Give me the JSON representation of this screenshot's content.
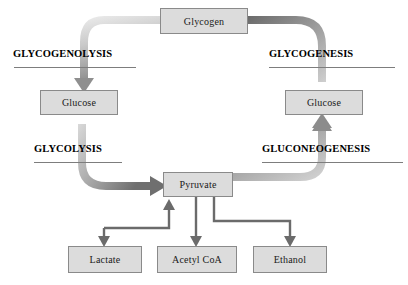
{
  "diagram": {
    "background": "#ffffff",
    "node_fill": "#dcdcdc",
    "node_border": "#8a8a8a",
    "band_light": "#e3e3e3",
    "band_dark": "#6e6e6e",
    "connector_color": "#6b6b6b",
    "label_color": "#000000"
  },
  "nodes": {
    "glycogen": "Glycogen",
    "glucose_left": "Glucose",
    "glucose_right": "Glucose",
    "pyruvate": "Pyruvate",
    "lactate": "Lactate",
    "acetyl_coa": "Acetyl CoA",
    "ethanol": "Ethanol"
  },
  "pathways": {
    "glycogenolysis": "GLYCOGENOLYSIS",
    "glycogenesis": "GLYCOGENESIS",
    "glycolysis": "GLYCOLYSIS",
    "gluconeogenesis": "GLUCONEOGENESIS"
  },
  "flows": [
    {
      "name": "glycogen-to-glucose-left",
      "from": "Glycogen",
      "to": "Glucose",
      "label": "GLYCOGENOLYSIS",
      "style": "thick-band",
      "direction": "down-left"
    },
    {
      "name": "glucose-left-to-pyruvate",
      "from": "Glucose",
      "to": "Pyruvate",
      "label": "GLYCOLYSIS",
      "style": "thick-band",
      "direction": "down-right"
    },
    {
      "name": "pyruvate-to-glucose-right",
      "from": "Pyruvate",
      "to": "Glucose",
      "label": "GLUCONEOGENESIS",
      "style": "thick-band",
      "direction": "right-up"
    },
    {
      "name": "glucose-right-to-glycogen",
      "from": "Glucose",
      "to": "Glycogen",
      "label": "GLYCOGENESIS",
      "style": "thick-band",
      "direction": "up-left"
    },
    {
      "name": "lactate-to-pyruvate",
      "from": "Lactate",
      "to": "Pyruvate",
      "style": "thin-elbow",
      "direction": "up"
    },
    {
      "name": "pyruvate-to-lactate",
      "from": "Pyruvate",
      "to": "Lactate",
      "style": "thin-elbow",
      "direction": "down"
    },
    {
      "name": "pyruvate-to-acetyl-coa",
      "from": "Pyruvate",
      "to": "Acetyl CoA",
      "style": "thin-line",
      "direction": "down"
    },
    {
      "name": "pyruvate-to-ethanol",
      "from": "Pyruvate",
      "to": "Ethanol",
      "style": "thin-elbow",
      "direction": "down-right"
    }
  ]
}
